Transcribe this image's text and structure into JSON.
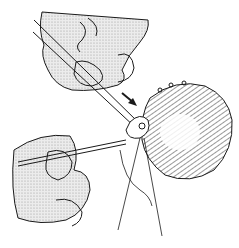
{
  "figure": {
    "elements": [
      "upper-hand",
      "upper-instrument",
      "direction-arrow",
      "tissue-mass",
      "knot",
      "lower-hand",
      "lower-instrument",
      "suture-threads"
    ],
    "caption": "",
    "colors": {
      "ink": "#1a1a1a",
      "shade": "#d9d9d9",
      "background": "#ffffff"
    }
  }
}
